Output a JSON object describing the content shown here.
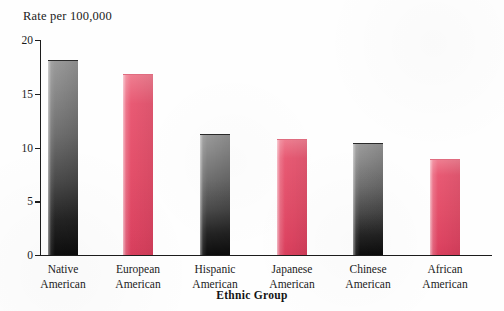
{
  "chart_data": {
    "type": "bar",
    "title": "",
    "ylabel": "Rate per 100,000",
    "xlabel": "Ethnic Group",
    "categories": [
      "Native American",
      "European American",
      "Hispanic American",
      "Japanese American",
      "Chinese American",
      "African American"
    ],
    "category_lines": [
      [
        "Native",
        "American"
      ],
      [
        "European",
        "American"
      ],
      [
        "Hispanic",
        "American"
      ],
      [
        "Japanese",
        "American"
      ],
      [
        "Chinese",
        "American"
      ],
      [
        "African",
        "American"
      ]
    ],
    "values": [
      18.1,
      16.8,
      11.3,
      10.8,
      10.4,
      8.9
    ],
    "bar_colors": [
      "dark",
      "red",
      "dark",
      "red",
      "dark",
      "red"
    ],
    "ylim": [
      0,
      20
    ],
    "yticks": [
      0,
      5,
      10,
      15,
      20
    ],
    "ytick_labels": [
      "0",
      "5",
      "10",
      "15",
      "20"
    ],
    "grid": false,
    "legend": false,
    "colors": {
      "red": "#e44f6a",
      "dark_top": "#9a9a9a",
      "dark_bottom": "#0d0d0d",
      "axis": "#1c1c1c",
      "text": "#1b1b1b",
      "background": "#fefefe"
    }
  }
}
